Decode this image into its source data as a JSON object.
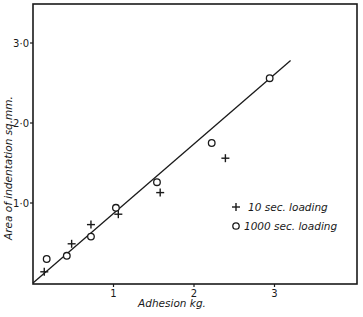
{
  "chart_data": {
    "type": "scatter",
    "title": "",
    "xlabel": "Adhesion kg.",
    "ylabel": "Area of indentation sq.mm.",
    "xlim": [
      0,
      4.0
    ],
    "ylim": [
      0,
      3.5
    ],
    "x_ticks": [
      1,
      2,
      3
    ],
    "x_tick_labels": [
      "1",
      "2",
      "3"
    ],
    "y_ticks": [
      1.0,
      2.0,
      3.0
    ],
    "y_tick_labels": [
      "1·0",
      "2·0",
      "3·0"
    ],
    "grid": false,
    "legend_position": "right-middle",
    "series": [
      {
        "name": "10 sec. loading",
        "marker": "plus",
        "points": [
          {
            "x": 0.14,
            "y": 0.14
          },
          {
            "x": 0.48,
            "y": 0.49
          },
          {
            "x": 0.72,
            "y": 0.73
          },
          {
            "x": 1.06,
            "y": 0.86
          },
          {
            "x": 1.58,
            "y": 1.13
          },
          {
            "x": 2.39,
            "y": 1.56
          }
        ]
      },
      {
        "name": "1000 sec. loading",
        "marker": "circle",
        "points": [
          {
            "x": 0.17,
            "y": 0.3
          },
          {
            "x": 0.42,
            "y": 0.34
          },
          {
            "x": 0.72,
            "y": 0.58
          },
          {
            "x": 1.03,
            "y": 0.94
          },
          {
            "x": 1.54,
            "y": 1.26
          },
          {
            "x": 2.22,
            "y": 1.75
          },
          {
            "x": 2.94,
            "y": 2.56
          }
        ]
      }
    ],
    "fit_line": {
      "description": "straight line fitted through both series",
      "start": {
        "x": 0.0,
        "y": 0.0
      },
      "end": {
        "x": 3.2,
        "y": 2.78
      }
    }
  },
  "legend": {
    "items": [
      {
        "symbol": "+",
        "label": "10 sec. loading"
      },
      {
        "symbol": "o",
        "label": "1000 sec. loading"
      }
    ]
  },
  "axes": {
    "xlabel": "Adhesion kg.",
    "ylabel": "Area of indentation sq.mm."
  }
}
